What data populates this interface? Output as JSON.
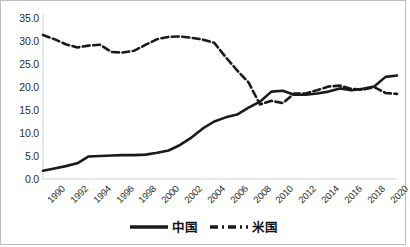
{
  "chart_data": {
    "type": "line",
    "title": "",
    "xlabel": "",
    "ylabel": "",
    "ylim": [
      0,
      35
    ],
    "ytick_step": 5,
    "ytick_labels": [
      "0.0",
      "5.0",
      "10.0",
      "15.0",
      "20.0",
      "25.0",
      "30.0",
      "35.0"
    ],
    "xlim": [
      1990,
      2021
    ],
    "xtick_labels": [
      "1990",
      "1992",
      "1994",
      "1996",
      "1998",
      "2000",
      "2002",
      "2004",
      "2006",
      "2008",
      "2010",
      "2012",
      "2014",
      "2016",
      "2018",
      "2020"
    ],
    "grid": false,
    "legend_position": "bottom-center",
    "x": [
      1990,
      1991,
      1992,
      1993,
      1994,
      1995,
      1996,
      1997,
      1998,
      1999,
      2000,
      2001,
      2002,
      2003,
      2004,
      2005,
      2006,
      2007,
      2008,
      2009,
      2010,
      2011,
      2012,
      2013,
      2014,
      2015,
      2016,
      2017,
      2018,
      2019,
      2020,
      2021
    ],
    "series": [
      {
        "name": "中国",
        "style": "solid",
        "color": "#1a1a1a",
        "values": [
          1.8,
          2.3,
          2.8,
          3.4,
          4.9,
          5.0,
          5.1,
          5.2,
          5.2,
          5.3,
          5.7,
          6.2,
          7.4,
          9.0,
          11.0,
          12.5,
          13.4,
          14.0,
          15.5,
          16.8,
          19.0,
          19.2,
          18.3,
          18.3,
          18.6,
          19.0,
          19.7,
          19.3,
          19.6,
          20.1,
          22.2,
          22.5
        ]
      },
      {
        "name": "米国",
        "style": "dashed",
        "color": "#1a1a1a",
        "values": [
          31.3,
          30.4,
          29.3,
          28.6,
          29.0,
          29.2,
          27.6,
          27.5,
          27.9,
          29.2,
          30.4,
          30.9,
          31.0,
          30.7,
          30.3,
          29.6,
          26.5,
          23.6,
          21.0,
          16.2,
          17.0,
          16.5,
          18.6,
          18.6,
          19.3,
          20.1,
          20.3,
          19.6,
          19.4,
          20.0,
          18.7,
          18.5
        ]
      }
    ]
  },
  "legend": {
    "items": [
      {
        "label": "中国",
        "key": "solid-line-key"
      },
      {
        "label": "米国",
        "key": "dashed-line-key"
      }
    ]
  }
}
